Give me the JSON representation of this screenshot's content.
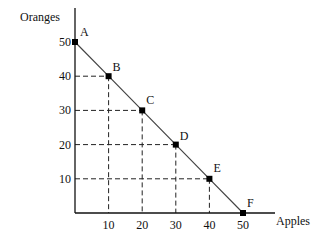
{
  "chart_data": {
    "type": "line",
    "title": "",
    "xlabel": "Apples",
    "ylabel": "Oranges",
    "xlim": [
      0,
      50
    ],
    "ylim": [
      0,
      50
    ],
    "xticks": [
      10,
      20,
      30,
      40,
      50
    ],
    "yticks": [
      10,
      20,
      30,
      40,
      50
    ],
    "grid": false,
    "dashed_guides": true,
    "series": [
      {
        "name": "Production possibilities frontier",
        "points": [
          {
            "label": "A",
            "x": 0,
            "y": 50
          },
          {
            "label": "B",
            "x": 10,
            "y": 40
          },
          {
            "label": "C",
            "x": 20,
            "y": 30
          },
          {
            "label": "D",
            "x": 30,
            "y": 20
          },
          {
            "label": "E",
            "x": 40,
            "y": 10
          },
          {
            "label": "F",
            "x": 50,
            "y": 0
          }
        ]
      }
    ]
  },
  "colors": {
    "line": "#444444",
    "axis": "#111111",
    "guide": "#222222",
    "marker": "#000000"
  }
}
